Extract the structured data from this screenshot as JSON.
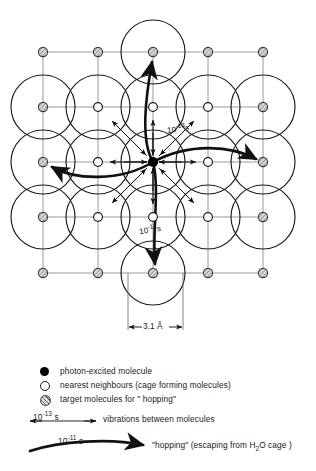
{
  "figure": {
    "type": "molecular-lattice-diagram",
    "lattice": {
      "rows": 5,
      "cols": 5,
      "cell_spacing_label": "3.1 Å",
      "cell_spacing_value": 3.1,
      "cell_spacing_unit": "Å",
      "border_node_type": "target-molecule",
      "interior_node_type": "nearest-neighbour",
      "center_node_type": "photon-excited-molecule"
    },
    "annotations": {
      "vibration_time": "10",
      "vibration_exponent": "-13",
      "vibration_unit": "s",
      "vibration_label": "10-13s",
      "hopping_time": "10",
      "hopping_exponent": "-11",
      "hopping_unit": "s",
      "hopping_label": "10-11s"
    },
    "dimension": {
      "label": "3.1 Å",
      "value": "3.1",
      "unit": "Å"
    }
  },
  "legend": {
    "items": [
      {
        "symbol": "filled-circle",
        "symbol_name": "photon-excited-molecule-symbol",
        "label": "photon-excited molecule"
      },
      {
        "symbol": "open-circle",
        "symbol_name": "nearest-neighbour-symbol",
        "label": "nearest neighbours (cage forming molecules)"
      },
      {
        "symbol": "hatched-circle",
        "symbol_name": "target-molecule-symbol",
        "label": "target molecules for \" hopping\""
      },
      {
        "symbol": "thin-double-arrow",
        "symbol_name": "vibration-arrow-symbol",
        "time_base": "10",
        "time_exponent": "-13",
        "time_unit": "s",
        "label": "vibrations between molecules"
      },
      {
        "symbol": "thick-curved-arrow",
        "symbol_name": "hopping-arrow-symbol",
        "time_base": "10",
        "time_exponent": "-11",
        "time_unit": "s",
        "label": "\"hopping\" (escaping from H2O cage)",
        "label_pre": "\"hopping\" (escaping from H",
        "label_sub": "2",
        "label_post": "O cage )"
      }
    ]
  },
  "colors": {
    "ink": "#111111",
    "grid_line": "#8a8a8a",
    "circle_outline": "#1a1a1a",
    "target_fill": "#9a9a9a",
    "excited_fill": "#000000",
    "background": "#ffffff"
  }
}
